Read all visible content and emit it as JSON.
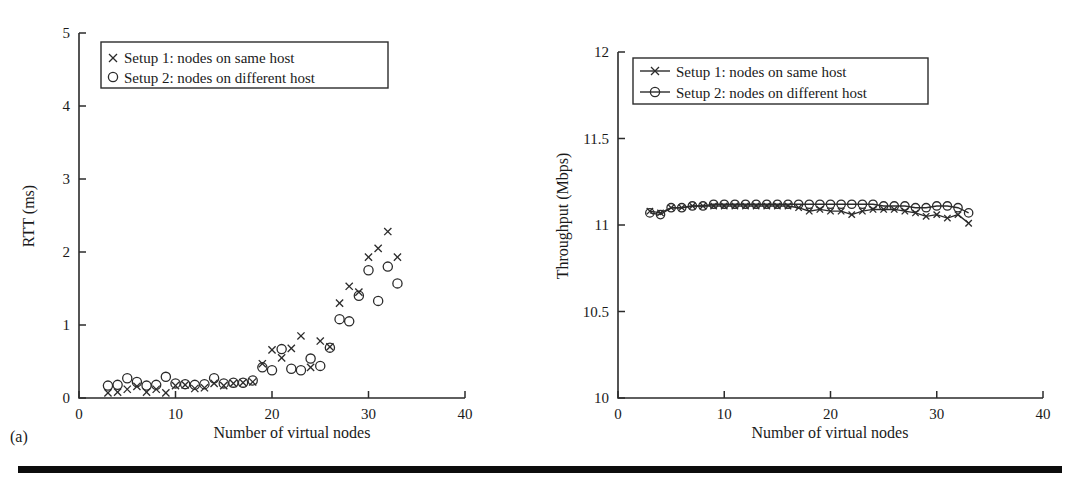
{
  "figure": {
    "panel_a_tag": "(a)",
    "panel_b_tag": "(b)"
  },
  "chart_data": [
    {
      "id": "rtt",
      "type": "scatter",
      "title": "",
      "xlabel": "Number of virtual nodes",
      "ylabel": "RTT (ms)",
      "xlim": [
        0,
        40
      ],
      "ylim": [
        0,
        5
      ],
      "xticks": [
        0,
        10,
        20,
        30,
        40
      ],
      "xtick_labels": [
        "0",
        "10",
        "20",
        "30",
        "40"
      ],
      "yticks": [
        0,
        1,
        2,
        3,
        4,
        5
      ],
      "ytick_labels": [
        "0",
        "1",
        "2",
        "3",
        "4",
        "5"
      ],
      "grid": false,
      "legend_position": "upper-left",
      "legend": [
        "Setup 1: nodes on same host",
        "Setup 2: nodes on different host"
      ],
      "series": [
        {
          "name": "Setup 1: nodes on same host",
          "marker": "x",
          "x": [
            3,
            4,
            5,
            6,
            7,
            8,
            9,
            10,
            11,
            12,
            13,
            14,
            15,
            16,
            17,
            18,
            19,
            20,
            21,
            22,
            23,
            24,
            25,
            26,
            27,
            28,
            29,
            30,
            31,
            32,
            33
          ],
          "y": [
            0.07,
            0.08,
            0.12,
            0.16,
            0.08,
            0.12,
            0.07,
            0.17,
            0.18,
            0.13,
            0.14,
            0.2,
            0.17,
            0.2,
            0.21,
            0.22,
            0.47,
            0.66,
            0.55,
            0.68,
            0.85,
            0.42,
            0.78,
            0.7,
            1.3,
            1.53,
            1.45,
            1.93,
            2.05,
            2.28,
            1.93
          ]
        },
        {
          "name": "Setup 2: nodes on different host",
          "marker": "o",
          "x": [
            3,
            4,
            5,
            6,
            7,
            8,
            9,
            10,
            11,
            12,
            13,
            14,
            15,
            16,
            17,
            18,
            19,
            20,
            21,
            22,
            23,
            24,
            25,
            26,
            27,
            28,
            29,
            30,
            31,
            32,
            33
          ],
          "y": [
            0.17,
            0.18,
            0.27,
            0.22,
            0.17,
            0.18,
            0.29,
            0.2,
            0.19,
            0.18,
            0.19,
            0.27,
            0.2,
            0.21,
            0.21,
            0.24,
            0.42,
            0.38,
            0.67,
            0.4,
            0.38,
            0.54,
            0.44,
            0.69,
            1.08,
            1.05,
            1.4,
            1.75,
            1.33,
            1.8,
            1.57
          ]
        }
      ]
    },
    {
      "id": "throughput",
      "type": "line",
      "title": "",
      "xlabel": "Number of virtual nodes",
      "ylabel": "Throughput (Mbps)",
      "xlim": [
        0,
        40
      ],
      "ylim": [
        10,
        12
      ],
      "xticks": [
        0,
        10,
        20,
        30,
        40
      ],
      "xtick_labels": [
        "0",
        "10",
        "20",
        "30",
        "40"
      ],
      "yticks": [
        10,
        10.5,
        11,
        11.5,
        12
      ],
      "ytick_labels": [
        "10",
        "10.5",
        "11",
        "11.5",
        "12"
      ],
      "grid": false,
      "legend_position": "upper-left",
      "legend": [
        "Setup 1: nodes on same host",
        "Setup 2: nodes on different host"
      ],
      "series": [
        {
          "name": "Setup 1: nodes on same host",
          "marker": "x",
          "x": [
            3,
            4,
            5,
            6,
            7,
            8,
            9,
            10,
            11,
            12,
            13,
            14,
            15,
            16,
            17,
            18,
            19,
            20,
            21,
            22,
            23,
            24,
            25,
            26,
            27,
            28,
            29,
            30,
            31,
            32,
            33
          ],
          "y": [
            11.08,
            11.07,
            11.1,
            11.1,
            11.11,
            11.11,
            11.11,
            11.11,
            11.11,
            11.11,
            11.11,
            11.11,
            11.11,
            11.11,
            11.1,
            11.08,
            11.09,
            11.08,
            11.08,
            11.06,
            11.08,
            11.09,
            11.09,
            11.09,
            11.08,
            11.07,
            11.05,
            11.06,
            11.04,
            11.06,
            11.01
          ]
        },
        {
          "name": "Setup 2: nodes on different host",
          "marker": "o",
          "x": [
            3,
            4,
            5,
            6,
            7,
            8,
            9,
            10,
            11,
            12,
            13,
            14,
            15,
            16,
            17,
            18,
            19,
            20,
            21,
            22,
            23,
            24,
            25,
            26,
            27,
            28,
            29,
            30,
            31,
            32,
            33
          ],
          "y": [
            11.07,
            11.06,
            11.1,
            11.1,
            11.11,
            11.11,
            11.12,
            11.12,
            11.12,
            11.12,
            11.12,
            11.12,
            11.12,
            11.12,
            11.12,
            11.12,
            11.12,
            11.12,
            11.12,
            11.12,
            11.12,
            11.12,
            11.11,
            11.11,
            11.11,
            11.1,
            11.1,
            11.11,
            11.11,
            11.1,
            11.07
          ]
        }
      ]
    }
  ]
}
